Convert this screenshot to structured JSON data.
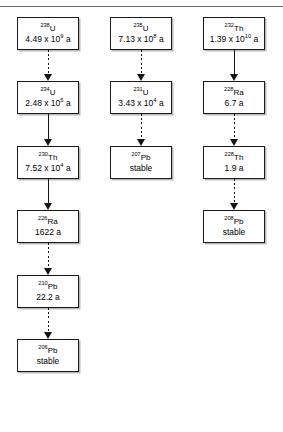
{
  "figure": {
    "caption_remnant": "",
    "background_color": "#ffffff",
    "line_color": "#141414",
    "box_border_color": "#1a1a1a",
    "shadow_color": "#b9b9b9"
  },
  "chains": [
    {
      "name": "uranium-238-series",
      "nuclides": [
        {
          "nuclide": "238U",
          "mass": "238",
          "element": "U",
          "halflife": "4.49 x 109 a",
          "halflife_mantissa": "4.49 x 10",
          "halflife_exponent": "9",
          "halflife_unit": " a",
          "stable": false
        },
        {
          "nuclide": "234U",
          "mass": "234",
          "element": "U",
          "halflife": "2.48 x 105 a",
          "halflife_mantissa": "2.48 x 10",
          "halflife_exponent": "5",
          "halflife_unit": " a",
          "stable": false
        },
        {
          "nuclide": "230Th",
          "mass": "230",
          "element": "Th",
          "halflife": "7.52 x 104 a",
          "halflife_mantissa": "7.52 x 10",
          "halflife_exponent": "4",
          "halflife_unit": " a",
          "stable": false
        },
        {
          "nuclide": "226Ra",
          "mass": "226",
          "element": "Ra",
          "halflife": "1622 a",
          "halflife_mantissa": "1622 a",
          "halflife_exponent": "",
          "halflife_unit": "",
          "stable": false
        },
        {
          "nuclide": "210Pb",
          "mass": "210",
          "element": "Pb",
          "halflife": "22.2 a",
          "halflife_mantissa": "22.2 a",
          "halflife_exponent": "",
          "halflife_unit": "",
          "stable": false
        },
        {
          "nuclide": "206Pb",
          "mass": "206",
          "element": "Pb",
          "halflife": "stable",
          "halflife_mantissa": "stable",
          "halflife_exponent": "",
          "halflife_unit": "",
          "stable": true
        }
      ],
      "arrows": [
        "dashed",
        "solid",
        "solid",
        "dashed",
        "dashed"
      ]
    },
    {
      "name": "uranium-235-series",
      "nuclides": [
        {
          "nuclide": "235U",
          "mass": "235",
          "element": "U",
          "halflife": "7.13 x 108 a",
          "halflife_mantissa": "7.13 x 10",
          "halflife_exponent": "8",
          "halflife_unit": " a",
          "stable": false
        },
        {
          "nuclide": "231U",
          "mass": "231",
          "element": "U",
          "halflife": "3.43 x 104 a",
          "halflife_mantissa": "3.43 x 10",
          "halflife_exponent": "4",
          "halflife_unit": " a",
          "stable": false
        },
        {
          "nuclide": "207Pb",
          "mass": "207",
          "element": "Pb",
          "halflife": "stable",
          "halflife_mantissa": "stable",
          "halflife_exponent": "",
          "halflife_unit": "",
          "stable": true
        }
      ],
      "arrows": [
        "dashed",
        "dashed"
      ]
    },
    {
      "name": "thorium-232-series",
      "nuclides": [
        {
          "nuclide": "232Th",
          "mass": "232",
          "element": "Th",
          "halflife": "1.39 x 1010 a",
          "halflife_mantissa": "1.39 x 10",
          "halflife_exponent": "10",
          "halflife_unit": " a",
          "stable": false
        },
        {
          "nuclide": "228Ra",
          "mass": "228",
          "element": "Ra",
          "halflife": "6.7 a",
          "halflife_mantissa": "6.7 a",
          "halflife_exponent": "",
          "halflife_unit": "",
          "stable": false
        },
        {
          "nuclide": "228Th",
          "mass": "228",
          "element": "Th",
          "halflife": "1.9 a",
          "halflife_mantissa": "1.9 a",
          "halflife_exponent": "",
          "halflife_unit": "",
          "stable": false
        },
        {
          "nuclide": "208Pb",
          "mass": "208",
          "element": "Pb",
          "halflife": "stable",
          "halflife_mantissa": "stable",
          "halflife_exponent": "",
          "halflife_unit": "",
          "stable": true
        }
      ],
      "arrows": [
        "solid",
        "dashed",
        "dashed"
      ]
    }
  ],
  "layout": {
    "column_x": [
      17,
      110,
      203
    ],
    "row_y": [
      17,
      81,
      146,
      210,
      275,
      339
    ],
    "box_width": 62,
    "box_height": 33
  }
}
